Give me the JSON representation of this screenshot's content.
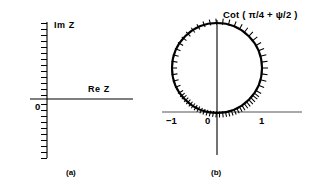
{
  "figure": {
    "background_color": "#ffffff",
    "ink_color": "#000000",
    "axis_gray": "#555555"
  },
  "panels": [
    {
      "id": "a",
      "caption": "(a)",
      "origin_label": "0",
      "axis_labels": {
        "vertical": "Im Z",
        "horizontal": "Re Z"
      },
      "vertical_axis": {
        "x": 47,
        "y_top": 22,
        "y_bottom": 158,
        "tick_count": 23,
        "tick_side": "left",
        "tick_length": 6
      },
      "horizontal_axis": {
        "y": 99,
        "x_left": 30,
        "x_right": 133
      }
    },
    {
      "id": "b",
      "caption": "(b)",
      "origin_label": "0",
      "formula_label": "Cot ( π/4 + ψ/2 )",
      "tick_labels": [
        "−1",
        "1"
      ],
      "circle": {
        "center_x": 217,
        "center_y": 68,
        "radius": 45,
        "radial_tick_count": 48,
        "tick_length": 6,
        "tick_direction": "outward"
      },
      "vertical_axis": {
        "x": 217,
        "y_top": 20,
        "y_bottom": 155
      },
      "horizontal_axis": {
        "y": 112,
        "x_left": 162,
        "x_right": 302
      },
      "tick_positions": {
        "minus_one_x": 172,
        "one_x": 262
      }
    }
  ]
}
